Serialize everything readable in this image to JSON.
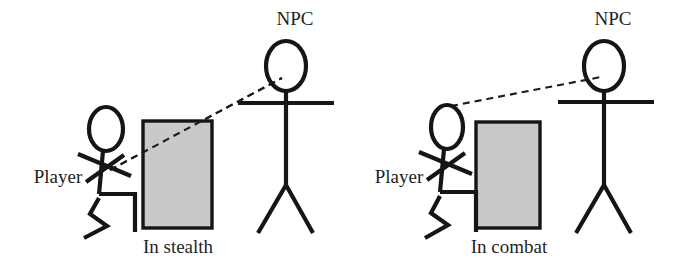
{
  "figure": {
    "background_color": "#ffffff",
    "ink_color": "#151515",
    "obstacle_fill_color": "#c9c9c9",
    "obstacle_border_color": "#151515",
    "sight_line_style": "dashed"
  },
  "panels": [
    {
      "id": "stealth",
      "caption": "In stealth",
      "player_label": "Player",
      "npc_label": "NPC",
      "player_pose": "crouching",
      "npc_pose": "standing",
      "obstacle_label": "",
      "sight_line_blocked": true,
      "sight_line_path": "through-obstacle"
    },
    {
      "id": "combat",
      "caption": "In combat",
      "player_label": "Player",
      "npc_label": "NPC",
      "player_pose": "crouching",
      "npc_pose": "standing",
      "obstacle_label": "",
      "sight_line_blocked": false,
      "sight_line_path": "over-obstacle"
    }
  ]
}
